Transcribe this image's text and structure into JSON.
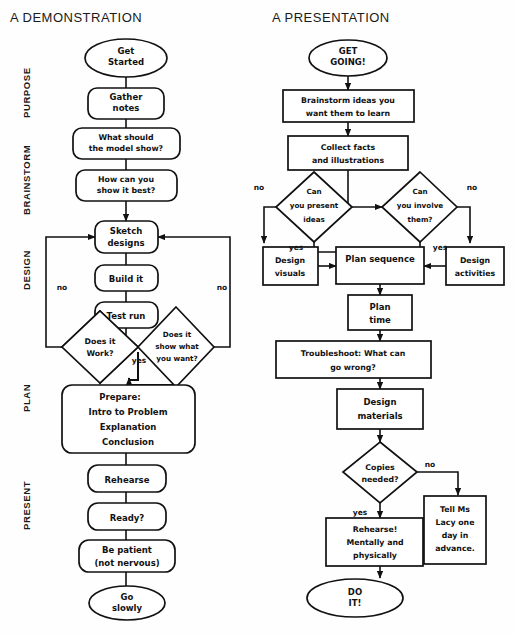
{
  "page": {
    "background": "#fefefe",
    "ink": "#111111"
  },
  "left_chart": {
    "title": "A DEMONSTRATION",
    "phase_labels": [
      "PURPOSE",
      "BRAINSTORM",
      "DESIGN",
      "PLAN",
      "PRESENT"
    ],
    "nodes": [
      {
        "id": "l1",
        "shape": "ellipse",
        "lines": [
          "Get",
          "Started"
        ]
      },
      {
        "id": "l2",
        "shape": "rounded",
        "lines": [
          "Gather",
          "notes"
        ]
      },
      {
        "id": "l3",
        "shape": "rounded",
        "lines": [
          "What should",
          "the model show?"
        ]
      },
      {
        "id": "l4",
        "shape": "rounded",
        "lines": [
          "How can you",
          "show it best?"
        ]
      },
      {
        "id": "l5",
        "shape": "rounded",
        "lines": [
          "Sketch",
          "designs"
        ]
      },
      {
        "id": "l6",
        "shape": "rounded",
        "lines": [
          "Build it"
        ]
      },
      {
        "id": "l7",
        "shape": "rounded",
        "lines": [
          "Test run"
        ]
      },
      {
        "id": "l8",
        "shape": "diamond",
        "lines": [
          "Does it",
          "Work?"
        ]
      },
      {
        "id": "l9",
        "shape": "diamond",
        "lines": [
          "Does it",
          "show what",
          "you want?"
        ]
      },
      {
        "id": "l10",
        "shape": "rounded",
        "lines": [
          "Prepare:",
          "Intro to Problem",
          "Explanation",
          "Conclusion"
        ]
      },
      {
        "id": "l11",
        "shape": "rounded",
        "lines": [
          "Rehearse"
        ]
      },
      {
        "id": "l12",
        "shape": "rounded",
        "lines": [
          "Ready?"
        ]
      },
      {
        "id": "l13",
        "shape": "rounded",
        "lines": [
          "Be patient",
          "(not nervous)"
        ]
      },
      {
        "id": "l14",
        "shape": "ellipse",
        "lines": [
          "Go",
          "slowly"
        ]
      }
    ],
    "edge_labels": {
      "no_left": "no",
      "no_right": "no",
      "yes_center": "yes"
    }
  },
  "right_chart": {
    "title": "A PRESENTATION",
    "nodes": [
      {
        "id": "r1",
        "shape": "ellipse",
        "lines": [
          "GET",
          "GOING!"
        ]
      },
      {
        "id": "r2",
        "shape": "rect",
        "lines": [
          "Brainstorm ideas you",
          "want them to learn"
        ]
      },
      {
        "id": "r3",
        "shape": "rect",
        "lines": [
          "Collect facts",
          "and illustrations"
        ]
      },
      {
        "id": "r4",
        "shape": "diamond",
        "lines": [
          "Can",
          "you present",
          "ideas"
        ]
      },
      {
        "id": "r5",
        "shape": "diamond",
        "lines": [
          "Can",
          "you involve",
          "them?"
        ]
      },
      {
        "id": "r6",
        "shape": "rect",
        "lines": [
          "Design",
          "visuals"
        ]
      },
      {
        "id": "r7",
        "shape": "rect",
        "lines": [
          "Plan sequence"
        ]
      },
      {
        "id": "r8",
        "shape": "rect",
        "lines": [
          "Design",
          "activities"
        ]
      },
      {
        "id": "r9",
        "shape": "rect",
        "lines": [
          "Plan",
          "time"
        ]
      },
      {
        "id": "r10",
        "shape": "rect",
        "lines": [
          "Troubleshoot: What can",
          "go wrong?"
        ]
      },
      {
        "id": "r11",
        "shape": "rect",
        "lines": [
          "Design",
          "materials"
        ]
      },
      {
        "id": "r12",
        "shape": "diamond",
        "lines": [
          "Copies",
          "needed?"
        ]
      },
      {
        "id": "r13",
        "shape": "rect",
        "lines": [
          "Tell Ms",
          "Lacy one",
          "day in",
          "advance."
        ]
      },
      {
        "id": "r14",
        "shape": "rect",
        "lines": [
          "Rehearse!",
          "Mentally and",
          "physically"
        ]
      },
      {
        "id": "r15",
        "shape": "ellipse",
        "lines": [
          "DO",
          "IT!"
        ]
      }
    ],
    "edge_labels": {
      "no_far_left": "no",
      "yes_left": "yes",
      "yes_right": "yes",
      "no_far_right": "no",
      "no_copies": "no",
      "yes_copies": "yes"
    }
  }
}
